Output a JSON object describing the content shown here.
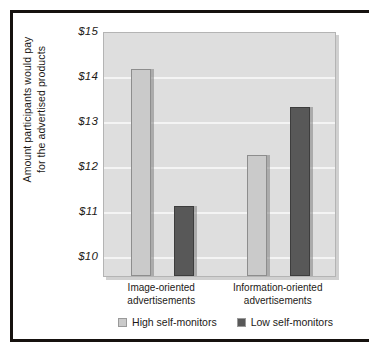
{
  "chart_data": {
    "type": "bar",
    "title": "",
    "subtitle": "",
    "xlabel": "",
    "ylabel_line1": "Amount participants would pay",
    "ylabel_line2": "for the advertised products",
    "categories": [
      {
        "line1": "Image-oriented",
        "line2": "advertisements"
      },
      {
        "line1": "Information-oriented",
        "line2": "advertisements"
      }
    ],
    "series": [
      {
        "name": "High self-monitors",
        "color": "#cacaca",
        "values": [
          14.15,
          12.25
        ]
      },
      {
        "name": "Low self-monitors",
        "color": "#585858",
        "values": [
          11.1,
          13.3
        ]
      }
    ],
    "ylim": [
      9.55,
      15.0
    ],
    "yticks": [
      15,
      14,
      13,
      12,
      11,
      10
    ],
    "ytick_labels": [
      "$15",
      "$14",
      "$13",
      "$12",
      "$11",
      "$10"
    ],
    "grid": true,
    "legend_position": "bottom",
    "plot_background": "#dedede",
    "gridline_color": "#f4f4f4",
    "frame_color": "#16120f"
  }
}
